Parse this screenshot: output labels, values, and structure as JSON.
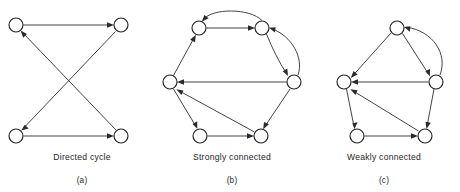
{
  "figure": {
    "background_color": "#ffffff",
    "stroke_color": "#2b2b2b",
    "node_fill": "#ffffff",
    "width": 460,
    "height": 192
  },
  "panels": [
    {
      "id": "a",
      "letter": "(a)",
      "caption": "Directed cycle",
      "caption_x": 82,
      "caption_y": 152,
      "letter_x": 82,
      "letter_y": 176,
      "node_count": 4,
      "edge_count": 4,
      "nodes": [
        {
          "name": "top-left",
          "cx": 16,
          "cy": 25,
          "r": 7
        },
        {
          "name": "top-right",
          "cx": 121,
          "cy": 25,
          "r": 7
        },
        {
          "name": "bottom-left",
          "cx": 16,
          "cy": 136,
          "r": 7
        },
        {
          "name": "bottom-right",
          "cx": 121,
          "cy": 136,
          "r": 7
        }
      ],
      "edges": [
        {
          "from": "top-left",
          "to": "top-right",
          "type": "straight"
        },
        {
          "from": "top-right",
          "to": "bottom-left",
          "type": "straight"
        },
        {
          "from": "bottom-left",
          "to": "bottom-right",
          "type": "straight"
        },
        {
          "from": "bottom-right",
          "to": "top-left",
          "type": "straight"
        }
      ]
    },
    {
      "id": "b",
      "letter": "(b)",
      "caption": "Strongly connected",
      "caption_x": 232,
      "caption_y": 152,
      "letter_x": 232,
      "letter_y": 176,
      "node_count": 6,
      "edge_count": 8,
      "nodes": [
        {
          "name": "top-left",
          "cx": 199,
          "cy": 28,
          "r": 7
        },
        {
          "name": "top-right",
          "cx": 262,
          "cy": 28,
          "r": 7
        },
        {
          "name": "right",
          "cx": 294,
          "cy": 82,
          "r": 7
        },
        {
          "name": "left",
          "cx": 170,
          "cy": 82,
          "r": 7
        },
        {
          "name": "bottom-left",
          "cx": 200,
          "cy": 136,
          "r": 7
        },
        {
          "name": "bottom-right",
          "cx": 261,
          "cy": 136,
          "r": 7
        }
      ],
      "edges": [
        {
          "from": "top-left",
          "to": "top-right",
          "type": "straight"
        },
        {
          "from": "top-right",
          "to": "top-left",
          "type": "curved"
        },
        {
          "from": "top-right",
          "to": "right",
          "type": "curved"
        },
        {
          "from": "right",
          "to": "top-right",
          "type": "curved"
        },
        {
          "from": "right",
          "to": "left",
          "type": "straight"
        },
        {
          "from": "right",
          "to": "bottom-right",
          "type": "straight"
        },
        {
          "from": "bottom-left",
          "to": "bottom-right",
          "type": "straight"
        },
        {
          "from": "bottom-right",
          "to": "left",
          "type": "straight"
        },
        {
          "from": "left",
          "to": "bottom-left",
          "type": "straight"
        },
        {
          "from": "left",
          "to": "top-left",
          "type": "straight"
        }
      ]
    },
    {
      "id": "c",
      "letter": "(c)",
      "caption": "Weakly connected",
      "caption_x": 384,
      "caption_y": 152,
      "letter_x": 384,
      "letter_y": 176,
      "node_count": 5,
      "edge_count": 7,
      "nodes": [
        {
          "name": "top",
          "cx": 397,
          "cy": 28,
          "r": 7
        },
        {
          "name": "right",
          "cx": 436,
          "cy": 82,
          "r": 7
        },
        {
          "name": "left",
          "cx": 344,
          "cy": 82,
          "r": 7
        },
        {
          "name": "bottom-left",
          "cx": 357,
          "cy": 136,
          "r": 7
        },
        {
          "name": "bottom-right",
          "cx": 425,
          "cy": 136,
          "r": 7
        }
      ],
      "edges": [
        {
          "from": "top",
          "to": "left",
          "type": "straight"
        },
        {
          "from": "top",
          "to": "right",
          "type": "straight"
        },
        {
          "from": "right",
          "to": "top",
          "type": "curved"
        },
        {
          "from": "right",
          "to": "left",
          "type": "straight"
        },
        {
          "from": "right",
          "to": "bottom-right",
          "type": "straight"
        },
        {
          "from": "left",
          "to": "bottom-left",
          "type": "straight"
        },
        {
          "from": "bottom-left",
          "to": "bottom-right",
          "type": "straight"
        },
        {
          "from": "bottom-right",
          "to": "left",
          "type": "straight"
        }
      ]
    }
  ]
}
